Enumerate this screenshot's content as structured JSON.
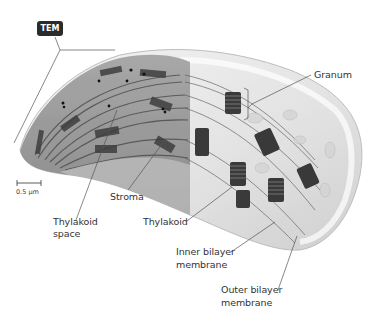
{
  "figure": {
    "tem_badge": "TEM",
    "scale_bar": {
      "label": "0.5 µm"
    },
    "labels": {
      "granum": "Granum",
      "stroma": "Stroma",
      "thylakoid_space_line1": "Thylakoid",
      "thylakoid_space_line2": "space",
      "thylakoid": "Thylakoid",
      "inner_membrane_line1": "Inner bilayer",
      "inner_membrane_line2": "membrane",
      "outer_membrane_line1": "Outer bilayer",
      "outer_membrane_line2": "membrane"
    },
    "colors": {
      "background": "#ffffff",
      "label_text": "#333333",
      "leader_line": "#555555",
      "badge_bg": "#2b2b2b",
      "tem_stroma": "#9a9a9a",
      "tem_thylakoid": "#4a4a4a",
      "envelope": "#e6e6e6",
      "granum_stack": "#3a3a3a"
    }
  }
}
